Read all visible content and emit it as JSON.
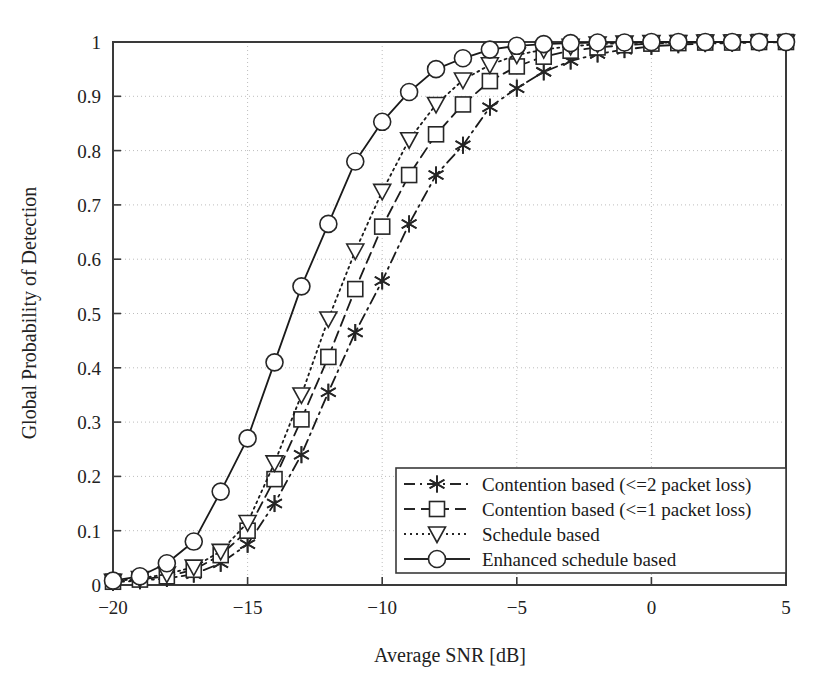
{
  "figure": {
    "background_color": "#ffffff",
    "ink_color": "#262626",
    "grid_color": "#bdbdbd"
  },
  "chart_data": {
    "type": "line",
    "title": "",
    "xlabel": "Average SNR [dB]",
    "ylabel": "Global Probability of Detection",
    "xlim": [
      -20,
      5
    ],
    "ylim": [
      0,
      1
    ],
    "xticks": [
      -20,
      -15,
      -10,
      -5,
      0,
      5
    ],
    "xtick_labels": [
      "−20",
      "−15",
      "−10",
      "−5",
      "0",
      "5"
    ],
    "yticks": [
      0,
      0.1,
      0.2,
      0.3,
      0.4,
      0.5,
      0.6,
      0.7,
      0.8,
      0.9,
      1
    ],
    "ytick_labels": [
      "0",
      "0.1",
      "0.2",
      "0.3",
      "0.4",
      "0.5",
      "0.6",
      "0.7",
      "0.8",
      "0.9",
      "1"
    ],
    "grid": true,
    "grid_style": "dotted",
    "legend_position": "lower right",
    "x": [
      -20,
      -19,
      -18,
      -17,
      -16,
      -15,
      -14,
      -13,
      -12,
      -11,
      -10,
      -9,
      -8,
      -7,
      -6,
      -5,
      -4,
      -3,
      -2,
      -1,
      0,
      1,
      2,
      3,
      4,
      5
    ],
    "series": [
      {
        "name": "Contention based (<=2 packet loss)",
        "marker": "asterisk",
        "line_style": "dashdot",
        "color": "#1a1a1a",
        "values": [
          0.005,
          0.008,
          0.012,
          0.02,
          0.04,
          0.075,
          0.15,
          0.24,
          0.355,
          0.465,
          0.56,
          0.665,
          0.755,
          0.81,
          0.88,
          0.915,
          0.945,
          0.965,
          0.978,
          0.986,
          0.992,
          0.995,
          0.997,
          0.998,
          0.999,
          1.0
        ]
      },
      {
        "name": "Contention based (<=1 packet loss)",
        "marker": "square",
        "line_style": "dashed",
        "color": "#1a1a1a",
        "values": [
          0.006,
          0.01,
          0.016,
          0.028,
          0.055,
          0.1,
          0.195,
          0.305,
          0.42,
          0.545,
          0.66,
          0.755,
          0.83,
          0.885,
          0.928,
          0.955,
          0.973,
          0.984,
          0.99,
          0.994,
          0.997,
          0.998,
          0.999,
          0.999,
          1.0,
          1.0
        ]
      },
      {
        "name": "Schedule based",
        "marker": "triangle-down",
        "line_style": "dotted",
        "color": "#1a1a1a",
        "values": [
          0.007,
          0.012,
          0.02,
          0.033,
          0.062,
          0.115,
          0.225,
          0.35,
          0.49,
          0.615,
          0.725,
          0.82,
          0.885,
          0.93,
          0.958,
          0.976,
          0.986,
          0.992,
          0.996,
          0.998,
          0.999,
          0.999,
          1.0,
          1.0,
          1.0,
          1.0
        ]
      },
      {
        "name": "Enhanced schedule based",
        "marker": "circle",
        "line_style": "solid",
        "color": "#1a1a1a",
        "values": [
          0.008,
          0.016,
          0.04,
          0.08,
          0.172,
          0.27,
          0.41,
          0.55,
          0.665,
          0.78,
          0.853,
          0.908,
          0.95,
          0.97,
          0.986,
          0.993,
          0.996,
          0.998,
          0.999,
          0.999,
          1.0,
          1.0,
          1.0,
          1.0,
          1.0,
          1.0
        ]
      }
    ]
  },
  "legend": {
    "entries": [
      {
        "label": "Contention based (<=2 packet loss)",
        "marker": "asterisk",
        "line_style": "dashdot"
      },
      {
        "label": "Contention based (<=1 packet loss)",
        "marker": "square",
        "line_style": "dashed"
      },
      {
        "label": "Schedule based",
        "marker": "triangle-down",
        "line_style": "dotted"
      },
      {
        "label": "Enhanced schedule based",
        "marker": "circle",
        "line_style": "solid"
      }
    ]
  }
}
